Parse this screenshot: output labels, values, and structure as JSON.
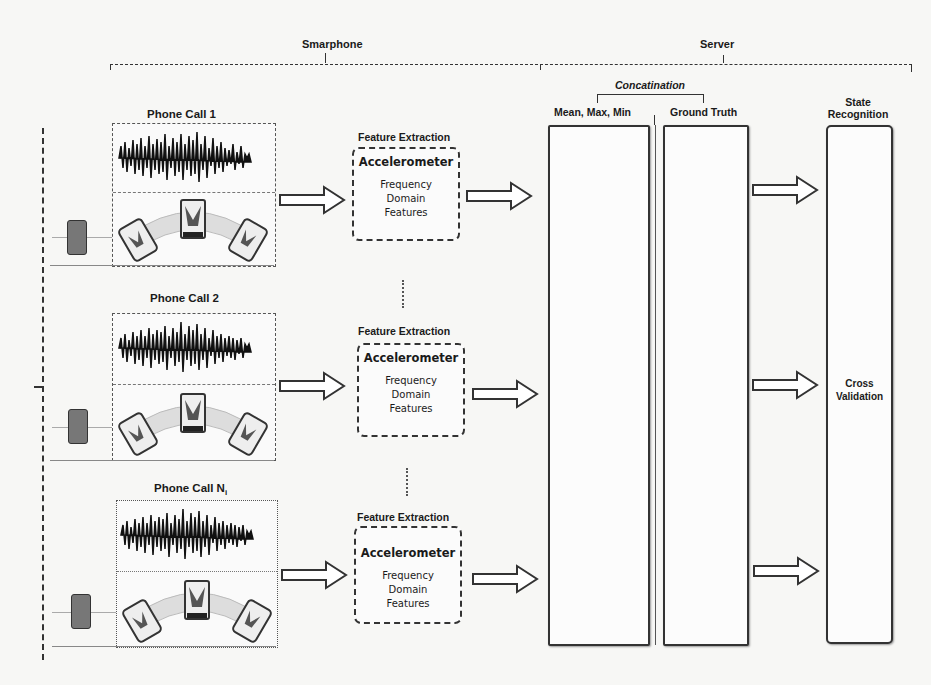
{
  "groups": {
    "smartphone": "Smarphone",
    "server": "Server"
  },
  "phone_calls": [
    {
      "label": "Phone Call 1",
      "subscript": ""
    },
    {
      "label": "Phone Call 2",
      "subscript": ""
    },
    {
      "label": "Phone Call N",
      "subscript": "i"
    }
  ],
  "feature_extraction": {
    "label": "Feature Extraction",
    "sensor": "Accelerometer",
    "features_line1": "Frequency",
    "features_line2": "Domain",
    "features_line3": "Features"
  },
  "server": {
    "concatenation": "Concatination",
    "col1": "Mean, Max, Min",
    "col2": "Ground Truth",
    "col3_line1": "State",
    "col3_line2": "Recognition",
    "cross_validation_line1": "Cross",
    "cross_validation_line2": "Validation"
  },
  "colors": {
    "line": "#333333",
    "background": "#f7f7f5",
    "phone": "#777777"
  }
}
